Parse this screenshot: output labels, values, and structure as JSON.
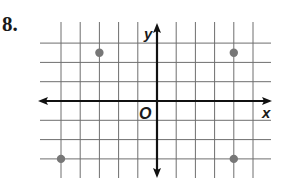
{
  "problem": {
    "number": "8."
  },
  "axes": {
    "x_label": "x",
    "y_label": "y",
    "origin_label": "O"
  },
  "colors": {
    "grid": "#6e6e6e",
    "axis": "#111111",
    "point": "#777777"
  },
  "chart_data": {
    "type": "scatter",
    "title": "",
    "xlabel": "x",
    "ylabel": "y",
    "origin_label": "O",
    "xlim": [
      -5,
      5
    ],
    "ylim": [
      -3,
      3
    ],
    "grid": true,
    "grid_spacing": 1,
    "tick_labels": false,
    "points": [
      {
        "x": -3,
        "y": 2.5
      },
      {
        "x": 4,
        "y": 2.5
      },
      {
        "x": -5,
        "y": -3
      },
      {
        "x": 4,
        "y": -3
      }
    ]
  }
}
